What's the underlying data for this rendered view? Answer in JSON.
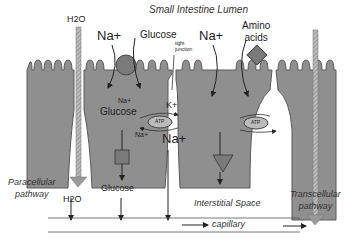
{
  "title": "Small Intestine Lumen",
  "labels": {
    "h2o_top": "H2O",
    "na_left": "Na+",
    "glucose_top": "Glucose",
    "tight_junction_1": "tight",
    "tight_junction_2": "junction",
    "na_right": "Na+",
    "amino_1": "Amino",
    "amino_2": "acids",
    "cell_na_small": "Na+",
    "cell_glucose": "Glucose",
    "cell_na_small_2": "Na+",
    "k_plus": "K+",
    "na_big": "Na+",
    "atp_1": "ATP",
    "atp_2": "ATP",
    "paracellular_1": "Paracellular",
    "paracellular_2": "pathway",
    "h2o_bottom": "H2O",
    "glucose_bottom": "Glucose",
    "interstitial": "Interstitial Space",
    "transcellular_1": "Transcellular",
    "transcellular_2": "pathway",
    "capillary": "capillary"
  },
  "colors": {
    "cell_fill": "#8f8f8f",
    "cell_stroke": "#5a5a5a",
    "arrow": "#222222",
    "background": "#ffffff"
  }
}
